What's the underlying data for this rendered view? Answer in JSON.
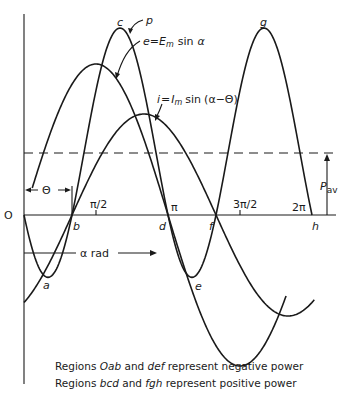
{
  "diagram": {
    "curves": {
      "voltage": {
        "label": "e = Em sin α",
        "label_parts": {
          "lhs": "e",
          "eq": "=",
          "E": "E",
          "sub": "m",
          "fn": "sin",
          "arg": "α"
        }
      },
      "current": {
        "label": "i = Im sin (α−Θ)",
        "label_parts": {
          "lhs": "i",
          "eq": "=",
          "I": "I",
          "sub": "m",
          "fn": "sin",
          "arg": "(α−Θ)"
        }
      },
      "power": {
        "label": "p"
      }
    },
    "points": {
      "origin": "O",
      "a": "a",
      "b": "b",
      "c": "c",
      "d": "d",
      "e": "e",
      "f": "f",
      "g": "g",
      "h": "h"
    },
    "axis_ticks": {
      "half_pi": "π/2",
      "pi": "π",
      "three_half_pi": "3π/2",
      "two_pi": "2π"
    },
    "axis_label": "α rad",
    "theta_label": "Θ",
    "average_power": {
      "label": "P",
      "sub": "av"
    },
    "caption": {
      "line1": {
        "prefix": "Regions ",
        "r1": "Oab",
        "mid": " and ",
        "r2": "def",
        "suffix": " represent negative power"
      },
      "line2": {
        "prefix": "Regions ",
        "r1": "bcd",
        "mid": " and ",
        "r2": "fgh",
        "suffix": " represent positive power"
      }
    }
  }
}
